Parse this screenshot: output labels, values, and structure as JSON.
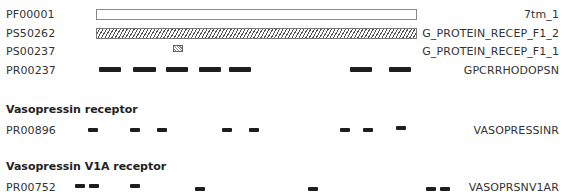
{
  "rows": [
    {
      "id": "PF00001",
      "name": "7tm_1"
    },
    {
      "id": "PS50262",
      "name": "G_PROTEIN_RECEP_F1_2"
    },
    {
      "id": "PS00237",
      "name": "G_PROTEIN_RECEP_F1_1"
    },
    {
      "id": "PR00237",
      "name": "GPCRRHODOPSN"
    },
    {
      "id": "PR00896",
      "name": "VASOPRESSINR"
    },
    {
      "id": "PR00752",
      "name": "VASOPRSNV1AR"
    }
  ],
  "sections": [
    {
      "title": "Vasopressin receptor"
    },
    {
      "title": "Vasopressin V1A receptor"
    }
  ],
  "colors": {
    "segment": "#1e1e1e",
    "box_border": "#888888"
  }
}
